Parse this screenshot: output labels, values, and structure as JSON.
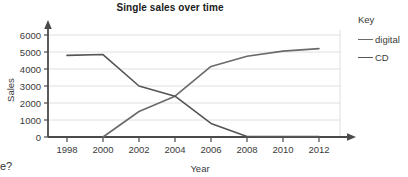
{
  "chart_data": {
    "type": "line",
    "title": "Single sales over time",
    "xlabel": "Year",
    "ylabel": "Sales",
    "x": [
      1998,
      2000,
      2002,
      2004,
      2006,
      2008,
      2010,
      2012
    ],
    "xticks": [
      "1998",
      "2000",
      "2002",
      "2004",
      "2006",
      "2008",
      "2010",
      "2012"
    ],
    "yticks": [
      "0",
      "1000",
      "2000",
      "3000",
      "4000",
      "5000",
      "6000"
    ],
    "xlim": [
      1997,
      2013
    ],
    "ylim": [
      0,
      6400
    ],
    "grid": "horizontal",
    "legend_position": "right",
    "legend_title": "Key",
    "series": [
      {
        "name": "digital",
        "color": "#6a6a6a",
        "values": [
          null,
          0,
          1500,
          2400,
          4150,
          4750,
          5050,
          5200
        ]
      },
      {
        "name": "CD",
        "color": "#555555",
        "values": [
          4800,
          4850,
          3000,
          2400,
          800,
          30,
          20,
          20
        ]
      }
    ]
  },
  "stray_text": "e?"
}
